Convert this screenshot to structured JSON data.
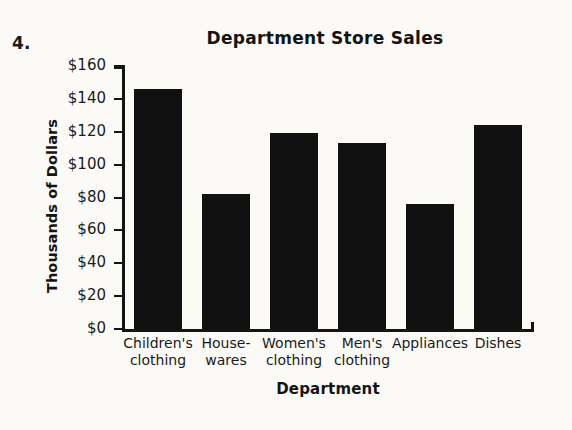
{
  "problem": {
    "number": "4."
  },
  "chart_data": {
    "type": "bar",
    "title": "Department Store Sales",
    "xlabel": "Department",
    "ylabel": "Thousands of Dollars",
    "categories": [
      "Children's clothing",
      "House-wares",
      "Women's clothing",
      "Men's clothing",
      "Appliances",
      "Dishes"
    ],
    "category_lines": [
      [
        "Children's",
        "clothing"
      ],
      [
        "House-",
        "wares"
      ],
      [
        "Women's",
        "clothing"
      ],
      [
        "Men's",
        "clothing"
      ],
      [
        "Appliances",
        ""
      ],
      [
        "Dishes",
        ""
      ]
    ],
    "values": [
      146,
      82,
      119,
      113,
      76,
      124
    ],
    "ylim": [
      0,
      160
    ],
    "ytick_values": [
      160,
      140,
      120,
      100,
      80,
      60,
      40,
      20,
      0
    ],
    "ytick_labels": [
      "$160",
      "$140",
      "$120",
      "$100",
      "$80",
      "$60",
      "$40",
      "$20",
      "$0"
    ],
    "grid": false,
    "legend": false,
    "bar_color": "#111111",
    "background_color": "#fbfaf7",
    "axis_color": "#141414"
  }
}
